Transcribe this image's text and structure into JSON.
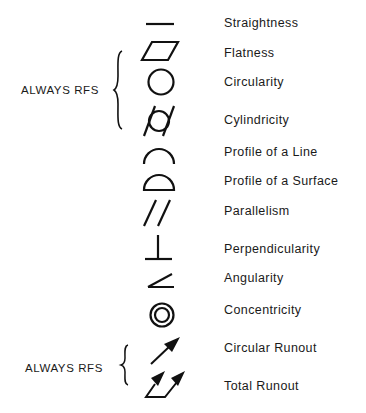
{
  "diagram": {
    "ink_color": "#111111",
    "groups": [
      {
        "label": "ALWAYS RFS",
        "covers": [
          "Flatness",
          "Circularity",
          "Cylindricity"
        ]
      },
      {
        "label": "ALWAYS RFS",
        "covers": [
          "Circular Runout",
          "Total Runout"
        ]
      }
    ],
    "symbols": [
      {
        "name": "Straightness",
        "icon": "straightness-line"
      },
      {
        "name": "Flatness",
        "icon": "flatness-parallelogram"
      },
      {
        "name": "Circularity",
        "icon": "circularity-circle"
      },
      {
        "name": "Cylindricity",
        "icon": "cylindricity-circle-with-slanted-lines"
      },
      {
        "name": "Profile of a Line",
        "icon": "profile-line-arc"
      },
      {
        "name": "Profile of a Surface",
        "icon": "profile-surface-closed-arc"
      },
      {
        "name": "Parallelism",
        "icon": "parallelism-double-slash"
      },
      {
        "name": "Perpendicularity",
        "icon": "perpendicularity-up-tack"
      },
      {
        "name": "Angularity",
        "icon": "angularity-angle"
      },
      {
        "name": "Concentricity",
        "icon": "concentricity-double-circle"
      },
      {
        "name": "Circular Runout",
        "icon": "circular-runout-arrow"
      },
      {
        "name": "Total Runout",
        "icon": "total-runout-double-arrow"
      }
    ]
  }
}
